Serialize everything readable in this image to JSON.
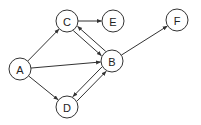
{
  "diagram": {
    "type": "directed-graph",
    "colors": {
      "stroke": "#333333",
      "node_fill": "#ffffff",
      "text": "#222222",
      "background": "#ffffff"
    },
    "node_radius": 11,
    "nodes": [
      {
        "id": "A",
        "label": "A",
        "x": 20,
        "y": 69
      },
      {
        "id": "B",
        "label": "B",
        "x": 112,
        "y": 61
      },
      {
        "id": "C",
        "label": "C",
        "x": 67,
        "y": 21
      },
      {
        "id": "D",
        "label": "D",
        "x": 67,
        "y": 107
      },
      {
        "id": "E",
        "label": "E",
        "x": 113,
        "y": 21
      },
      {
        "id": "F",
        "label": "F",
        "x": 177,
        "y": 20
      }
    ],
    "edges": [
      {
        "from": "A",
        "to": "C",
        "offset": 0
      },
      {
        "from": "A",
        "to": "B",
        "offset": 0
      },
      {
        "from": "A",
        "to": "D",
        "offset": 0
      },
      {
        "from": "C",
        "to": "E",
        "offset": 0
      },
      {
        "from": "C",
        "to": "B",
        "offset": 3
      },
      {
        "from": "B",
        "to": "C",
        "offset": 3
      },
      {
        "from": "B",
        "to": "D",
        "offset": 3
      },
      {
        "from": "D",
        "to": "B",
        "offset": 3
      },
      {
        "from": "B",
        "to": "F",
        "offset": 0
      }
    ]
  }
}
